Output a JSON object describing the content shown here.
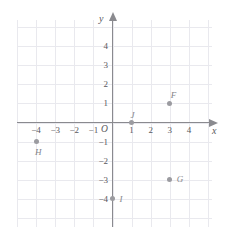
{
  "chart_data": {
    "type": "scatter",
    "title": "",
    "xlabel": "x",
    "ylabel": "y",
    "origin_label": "O",
    "grid": true,
    "xlim": [
      -5,
      5
    ],
    "ylim": [
      -5,
      5
    ],
    "x_ticks": [
      "−4",
      "−3",
      "−2",
      "−1",
      "1",
      "2",
      "3",
      "4"
    ],
    "x_tick_values": [
      -4,
      -3,
      -2,
      -1,
      1,
      2,
      3,
      4
    ],
    "y_ticks": [
      "4",
      "3",
      "2",
      "1",
      "−1",
      "−2",
      "−3",
      "−4"
    ],
    "y_tick_values": [
      4,
      3,
      2,
      1,
      -1,
      -2,
      -3,
      -4
    ],
    "points": [
      {
        "label": "F",
        "x": 3,
        "y": 1
      },
      {
        "label": "G",
        "x": 3,
        "y": -3
      },
      {
        "label": "H",
        "x": -4,
        "y": -1
      },
      {
        "label": "I",
        "x": 0,
        "y": -4
      },
      {
        "label": "J",
        "x": 1,
        "y": 0
      }
    ],
    "colors": {
      "grid": "#e9e9ee",
      "axis": "#8a8a8f",
      "point": "#9b9ba0",
      "point_label": "#84848a",
      "tick_label": "#58585c",
      "background": "#ffffff"
    }
  }
}
